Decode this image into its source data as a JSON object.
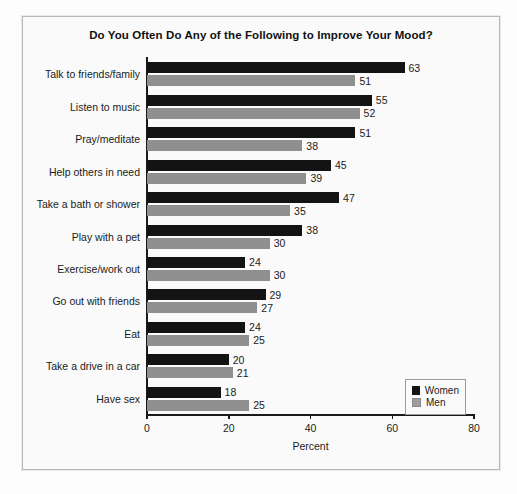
{
  "chart_data": {
    "type": "bar",
    "orientation": "horizontal",
    "title": "Do You Often Do Any of the Following to Improve Your Mood?",
    "xlabel": "Percent",
    "ylabel": "",
    "xlim": [
      0,
      80
    ],
    "xticks": [
      0,
      20,
      40,
      60,
      80
    ],
    "grid": false,
    "legend_position": "bottom-right",
    "categories": [
      "Talk to friends/family",
      "Listen to music",
      "Pray/meditate",
      "Help others in need",
      "Take a bath or shower",
      "Play with a pet",
      "Exercise/work out",
      "Go out with friends",
      "Eat",
      "Take a drive in a car",
      "Have sex"
    ],
    "series": [
      {
        "name": "Women",
        "color": "#131313",
        "values": [
          63,
          55,
          51,
          45,
          47,
          38,
          24,
          29,
          24,
          20,
          18
        ]
      },
      {
        "name": "Men",
        "color": "#8f8f8f",
        "values": [
          51,
          52,
          38,
          39,
          35,
          30,
          30,
          27,
          25,
          21,
          25
        ]
      }
    ]
  },
  "legend": {
    "items": [
      {
        "label": "Women",
        "color": "#131313"
      },
      {
        "label": "Men",
        "color": "#9e9e9e"
      }
    ]
  }
}
